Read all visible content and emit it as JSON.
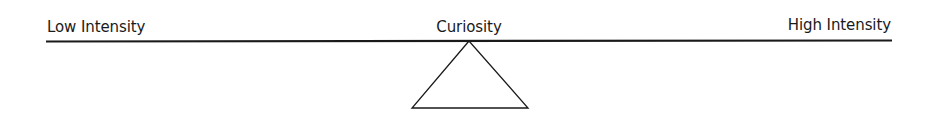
{
  "diagram": {
    "type": "seesaw-scale",
    "left_label": "Low Intensity",
    "center_label": "Curiosity",
    "right_label": "High Intensity",
    "line_color": "#1a1a1a"
  }
}
